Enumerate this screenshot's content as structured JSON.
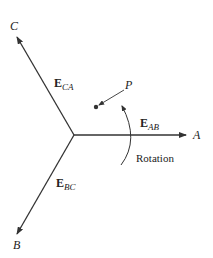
{
  "diagram": {
    "vectors": [
      {
        "id": "E_AB",
        "label_main": "E",
        "label_sub": "AB",
        "endpoint": "A"
      },
      {
        "id": "E_BC",
        "label_main": "E",
        "label_sub": "BC",
        "endpoint": "B"
      },
      {
        "id": "E_CA",
        "label_main": "E",
        "label_sub": "CA",
        "endpoint": "C"
      }
    ],
    "points": {
      "A": "A",
      "B": "B",
      "C": "C",
      "P": "P"
    },
    "rotation_label": "Rotation",
    "colors": {
      "line": "#333333",
      "text": "#222222"
    }
  }
}
